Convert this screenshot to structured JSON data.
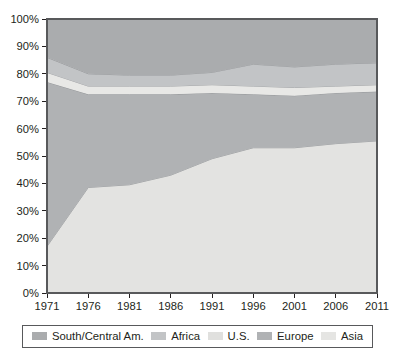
{
  "chart_data": {
    "type": "area",
    "stacked": true,
    "title": "",
    "subtitle": "",
    "xlabel": "",
    "ylabel": "",
    "categories": [
      "1971",
      "1976",
      "1981",
      "1986",
      "1991",
      "1996",
      "2001",
      "2006",
      "2011"
    ],
    "x_tick_labels": [
      "1971",
      "1976",
      "1981",
      "1986",
      "1991",
      "1996",
      "2001",
      "2006",
      "2011"
    ],
    "y_tick_labels": [
      "0%",
      "10%",
      "20%",
      "30%",
      "40%",
      "50%",
      "60%",
      "70%",
      "80%",
      "90%",
      "100%"
    ],
    "y_tick_values": [
      0,
      10,
      20,
      30,
      40,
      50,
      60,
      70,
      80,
      90,
      100
    ],
    "ylim": [
      0,
      100
    ],
    "y_unit": "%",
    "grid": false,
    "legend_position": "bottom",
    "stack_order_bottom_to_top": [
      "Asia",
      "Europe",
      "U.S.",
      "Africa",
      "South/Central Am."
    ],
    "series": [
      {
        "name": "Asia",
        "color": "#e3e3e1",
        "values": [
          17.0,
          38.5,
          39.5,
          43.0,
          49.0,
          53.0,
          53.0,
          54.5,
          55.5
        ]
      },
      {
        "name": "Europe",
        "color": "#b0b2b4",
        "values": [
          60.0,
          34.0,
          33.0,
          29.5,
          24.0,
          19.5,
          19.0,
          18.5,
          18.0
        ]
      },
      {
        "name": "U.S.",
        "color": "#e8e8e6",
        "values": [
          3.5,
          3.0,
          3.0,
          3.0,
          3.0,
          3.0,
          3.0,
          2.5,
          2.5
        ]
      },
      {
        "name": "Africa",
        "color": "#c2c4c6",
        "values": [
          5.5,
          4.5,
          4.0,
          4.0,
          4.5,
          8.0,
          7.5,
          8.0,
          8.0
        ]
      },
      {
        "name": "South/Central Am.",
        "color": "#aaacae",
        "values": [
          14.0,
          20.0,
          20.5,
          20.5,
          19.5,
          16.5,
          17.5,
          16.5,
          16.0
        ]
      }
    ],
    "cumulative_upper_boundaries_percent": {
      "Asia": [
        17.0,
        38.5,
        39.5,
        43.0,
        49.0,
        53.0,
        53.0,
        54.5,
        55.5
      ],
      "Europe": [
        77.0,
        72.5,
        72.5,
        72.5,
        73.0,
        72.5,
        72.0,
        73.0,
        73.5
      ],
      "U.S.": [
        80.5,
        75.5,
        75.5,
        75.5,
        76.0,
        75.5,
        75.0,
        75.5,
        76.0
      ],
      "Africa": [
        86.0,
        80.0,
        79.5,
        79.5,
        80.5,
        83.5,
        82.5,
        83.5,
        84.0
      ],
      "South/Central Am.": [
        100.0,
        100.0,
        100.0,
        100.0,
        100.0,
        100.0,
        100.0,
        100.0,
        100.0
      ]
    }
  },
  "legend": {
    "items": [
      {
        "label": "South/Central Am.",
        "color": "#aaacae"
      },
      {
        "label": "Africa",
        "color": "#c2c4c6"
      },
      {
        "label": "U.S.",
        "color": "#e0e0de"
      },
      {
        "label": "Europe",
        "color": "#b0b2b4"
      },
      {
        "label": "Asia",
        "color": "#e5e5e3"
      }
    ]
  },
  "axes": {
    "frame_color": "#58595b",
    "tick_color": "#231f20"
  }
}
